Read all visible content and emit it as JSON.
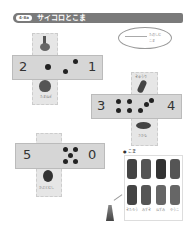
{
  "header": {
    "badge": "4-8a",
    "title": "サイコロとこま"
  },
  "note": {
    "line1": "たのしむ",
    "line2": "こま"
  },
  "dice": [
    {
      "left_number": "2",
      "right_number": "1",
      "top_icon": "bottle-icon",
      "bottom_icon": "onion-icon",
      "bottom_caption": "たまねぎ"
    },
    {
      "left_number": "3",
      "right_number": "4",
      "top_icon": "cucumber-icon",
      "top_caption": "きゅうり",
      "bottom_icon": "fish-icon",
      "bottom_caption": "さかな"
    },
    {
      "left_number": "5",
      "right_number": "0",
      "bottom_icon": "beetle-icon",
      "bottom_caption": "かぶとむし"
    }
  ],
  "pieces": {
    "label": "● こま",
    "captions": [
      "きたろう",
      "みずき",
      "ねずみ",
      "ゆうこ"
    ]
  }
}
